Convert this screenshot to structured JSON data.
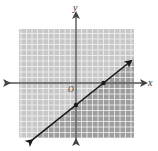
{
  "chart_data": {
    "type": "line",
    "title": "",
    "xlabel": "x",
    "ylabel": "y",
    "origin_label": "O",
    "grid": true,
    "xlim": [
      -10,
      10
    ],
    "ylim": [
      -10,
      10
    ],
    "series": [
      {
        "name": "boundary line",
        "equation": "y = (4/5)x - 4",
        "slope": 0.8,
        "intercept": -4,
        "x": [
          -8,
          10
        ],
        "y": [
          -10.4,
          4
        ],
        "marked_points": [
          {
            "x": 0,
            "y": -4
          },
          {
            "x": 5,
            "y": 0
          }
        ],
        "arrows": "both ends"
      }
    ],
    "shaded_region": "below the line (darker gray), above the line lighter gray",
    "colors": {
      "region_light": "#c8c8c8",
      "region_dark": "#9e9e9e",
      "grid_line": "#f2f2f2",
      "axis": "#555555",
      "line": "#1a1a1a"
    }
  },
  "labels": {
    "x_axis": "x",
    "y_axis": "y",
    "origin": "O"
  }
}
